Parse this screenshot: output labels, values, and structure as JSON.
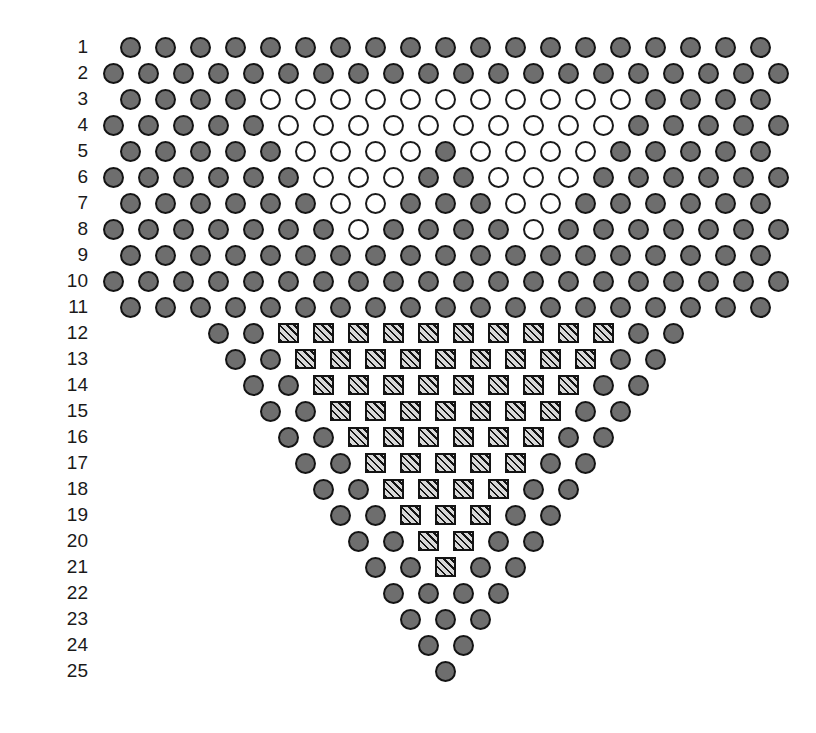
{
  "figure": {
    "title": "",
    "type": "symbol-grid-triangle",
    "width": 816,
    "height": 733,
    "background": "#ffffff",
    "legend_colors": {
      "filled_circle_fill": "#6e6e6e",
      "filled_circle_stroke": "#141414",
      "open_circle_fill": "#ffffff",
      "open_circle_stroke": "#1a1a1a",
      "hatched_square_fill": "#8a8a8a",
      "hatched_square_stroke": "#141414"
    },
    "symbol_legend": {
      "F": "filled-gray-circle",
      "O": "open-white-circle",
      "H": "hatched-square"
    },
    "geometry": {
      "cell_pitch_x": 35,
      "row_pitch_y": 26,
      "label_right_edge_x": 88,
      "grid_origin_x": 103,
      "grid_origin_y": 34,
      "half_step_x": 17
    }
  },
  "rows": [
    {
      "label": "1",
      "indent_cells": 0,
      "half_offset": true,
      "count": 19,
      "cells": [
        "F",
        "F",
        "F",
        "F",
        "F",
        "F",
        "F",
        "F",
        "F",
        "F",
        "F",
        "F",
        "F",
        "F",
        "F",
        "F",
        "F",
        "F",
        "F"
      ]
    },
    {
      "label": "2",
      "indent_cells": 0,
      "half_offset": false,
      "count": 20,
      "cells": [
        "F",
        "F",
        "F",
        "F",
        "F",
        "F",
        "F",
        "F",
        "F",
        "F",
        "F",
        "F",
        "F",
        "F",
        "F",
        "F",
        "F",
        "F",
        "F",
        "F"
      ]
    },
    {
      "label": "3",
      "indent_cells": 0,
      "half_offset": true,
      "count": 19,
      "cells": [
        "F",
        "F",
        "F",
        "F",
        "O",
        "O",
        "O",
        "O",
        "O",
        "O",
        "O",
        "O",
        "O",
        "O",
        "O",
        "F",
        "F",
        "F",
        "F"
      ]
    },
    {
      "label": "4",
      "indent_cells": 0,
      "half_offset": false,
      "count": 20,
      "cells": [
        "F",
        "F",
        "F",
        "F",
        "F",
        "O",
        "O",
        "O",
        "O",
        "O",
        "O",
        "O",
        "O",
        "O",
        "O",
        "F",
        "F",
        "F",
        "F",
        "F"
      ]
    },
    {
      "label": "5",
      "indent_cells": 0,
      "half_offset": true,
      "count": 19,
      "cells": [
        "F",
        "F",
        "F",
        "F",
        "F",
        "O",
        "O",
        "O",
        "O",
        "F",
        "O",
        "O",
        "O",
        "O",
        "F",
        "F",
        "F",
        "F",
        "F"
      ]
    },
    {
      "label": "6",
      "indent_cells": 0,
      "half_offset": false,
      "count": 20,
      "cells": [
        "F",
        "F",
        "F",
        "F",
        "F",
        "F",
        "O",
        "O",
        "O",
        "F",
        "F",
        "O",
        "O",
        "O",
        "F",
        "F",
        "F",
        "F",
        "F",
        "F"
      ]
    },
    {
      "label": "7",
      "indent_cells": 0,
      "half_offset": true,
      "count": 19,
      "cells": [
        "F",
        "F",
        "F",
        "F",
        "F",
        "F",
        "O",
        "O",
        "F",
        "F",
        "F",
        "O",
        "O",
        "F",
        "F",
        "F",
        "F",
        "F",
        "F"
      ]
    },
    {
      "label": "8",
      "indent_cells": 0,
      "half_offset": false,
      "count": 20,
      "cells": [
        "F",
        "F",
        "F",
        "F",
        "F",
        "F",
        "F",
        "O",
        "F",
        "F",
        "F",
        "F",
        "O",
        "F",
        "F",
        "F",
        "F",
        "F",
        "F",
        "F"
      ]
    },
    {
      "label": "9",
      "indent_cells": 0,
      "half_offset": true,
      "count": 19,
      "cells": [
        "F",
        "F",
        "F",
        "F",
        "F",
        "F",
        "F",
        "F",
        "F",
        "F",
        "F",
        "F",
        "F",
        "F",
        "F",
        "F",
        "F",
        "F",
        "F"
      ]
    },
    {
      "label": "10",
      "indent_cells": 0,
      "half_offset": false,
      "count": 20,
      "cells": [
        "F",
        "F",
        "F",
        "F",
        "F",
        "F",
        "F",
        "F",
        "F",
        "F",
        "F",
        "F",
        "F",
        "F",
        "F",
        "F",
        "F",
        "F",
        "F",
        "F"
      ]
    },
    {
      "label": "11",
      "indent_cells": 0,
      "half_offset": true,
      "count": 19,
      "cells": [
        "F",
        "F",
        "F",
        "F",
        "F",
        "F",
        "F",
        "F",
        "F",
        "F",
        "F",
        "F",
        "F",
        "F",
        "F",
        "F",
        "F",
        "F",
        "F"
      ]
    },
    {
      "label": "12",
      "indent_cells": 3,
      "half_offset": false,
      "count": 14,
      "cells": [
        "F",
        "F",
        "H",
        "H",
        "H",
        "H",
        "H",
        "H",
        "H",
        "H",
        "H",
        "H",
        "F",
        "F"
      ]
    },
    {
      "label": "13",
      "indent_cells": 3,
      "half_offset": true,
      "count": 13,
      "cells": [
        "F",
        "F",
        "H",
        "H",
        "H",
        "H",
        "H",
        "H",
        "H",
        "H",
        "H",
        "F",
        "F"
      ]
    },
    {
      "label": "14",
      "indent_cells": 4,
      "half_offset": false,
      "count": 12,
      "cells": [
        "F",
        "F",
        "H",
        "H",
        "H",
        "H",
        "H",
        "H",
        "H",
        "H",
        "F",
        "F"
      ]
    },
    {
      "label": "15",
      "indent_cells": 4,
      "half_offset": true,
      "count": 11,
      "cells": [
        "F",
        "F",
        "H",
        "H",
        "H",
        "H",
        "H",
        "H",
        "H",
        "F",
        "F"
      ]
    },
    {
      "label": "16",
      "indent_cells": 5,
      "half_offset": false,
      "count": 10,
      "cells": [
        "F",
        "F",
        "H",
        "H",
        "H",
        "H",
        "H",
        "H",
        "F",
        "F"
      ]
    },
    {
      "label": "17",
      "indent_cells": 5,
      "half_offset": true,
      "count": 9,
      "cells": [
        "F",
        "F",
        "H",
        "H",
        "H",
        "H",
        "H",
        "F",
        "F"
      ]
    },
    {
      "label": "18",
      "indent_cells": 6,
      "half_offset": false,
      "count": 8,
      "cells": [
        "F",
        "F",
        "H",
        "H",
        "H",
        "H",
        "F",
        "F"
      ]
    },
    {
      "label": "19",
      "indent_cells": 6,
      "half_offset": true,
      "count": 7,
      "cells": [
        "F",
        "F",
        "H",
        "H",
        "H",
        "F",
        "F"
      ]
    },
    {
      "label": "20",
      "indent_cells": 7,
      "half_offset": false,
      "count": 6,
      "cells": [
        "F",
        "F",
        "H",
        "H",
        "F",
        "F"
      ]
    },
    {
      "label": "21",
      "indent_cells": 7,
      "half_offset": true,
      "count": 5,
      "cells": [
        "F",
        "F",
        "H",
        "F",
        "F"
      ]
    },
    {
      "label": "22",
      "indent_cells": 8,
      "half_offset": false,
      "count": 4,
      "cells": [
        "F",
        "F",
        "F",
        "F"
      ]
    },
    {
      "label": "23",
      "indent_cells": 8,
      "half_offset": true,
      "count": 3,
      "cells": [
        "F",
        "F",
        "F"
      ]
    },
    {
      "label": "24",
      "indent_cells": 9,
      "half_offset": false,
      "count": 2,
      "cells": [
        "F",
        "F"
      ]
    },
    {
      "label": "25",
      "indent_cells": 9,
      "half_offset": true,
      "count": 1,
      "cells": [
        "F"
      ]
    }
  ]
}
